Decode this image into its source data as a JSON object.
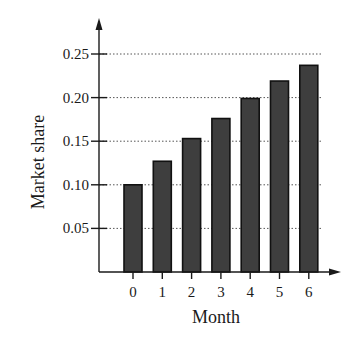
{
  "chart_data": {
    "type": "bar",
    "title": "",
    "xlabel": "Month",
    "ylabel": "Market share",
    "categories": [
      "0",
      "1",
      "2",
      "3",
      "4",
      "5",
      "6"
    ],
    "values": [
      0.1,
      0.127,
      0.153,
      0.176,
      0.199,
      0.219,
      0.237
    ],
    "ylim": [
      0,
      0.27
    ],
    "yticks": [
      0.05,
      0.1,
      0.15,
      0.2,
      0.25
    ],
    "ytick_labels": [
      "0.05",
      "0.10",
      "0.15",
      "0.20",
      "0.25"
    ],
    "grid": "horizontal dotted",
    "legend": null,
    "colors": {
      "bar_fill": "#3e3e3e",
      "bar_edge": "#111111",
      "grid": "#555555",
      "axis": "#1a1a1a"
    }
  },
  "layout": {
    "origin_x": 99,
    "origin_y": 272,
    "px_per_unit_y": 872,
    "first_bar_center_x": 133,
    "bar_spacing": 29.3,
    "bar_width": 18,
    "grid_right_x": 323,
    "x_axis_end": 341,
    "y_axis_top": 18
  }
}
